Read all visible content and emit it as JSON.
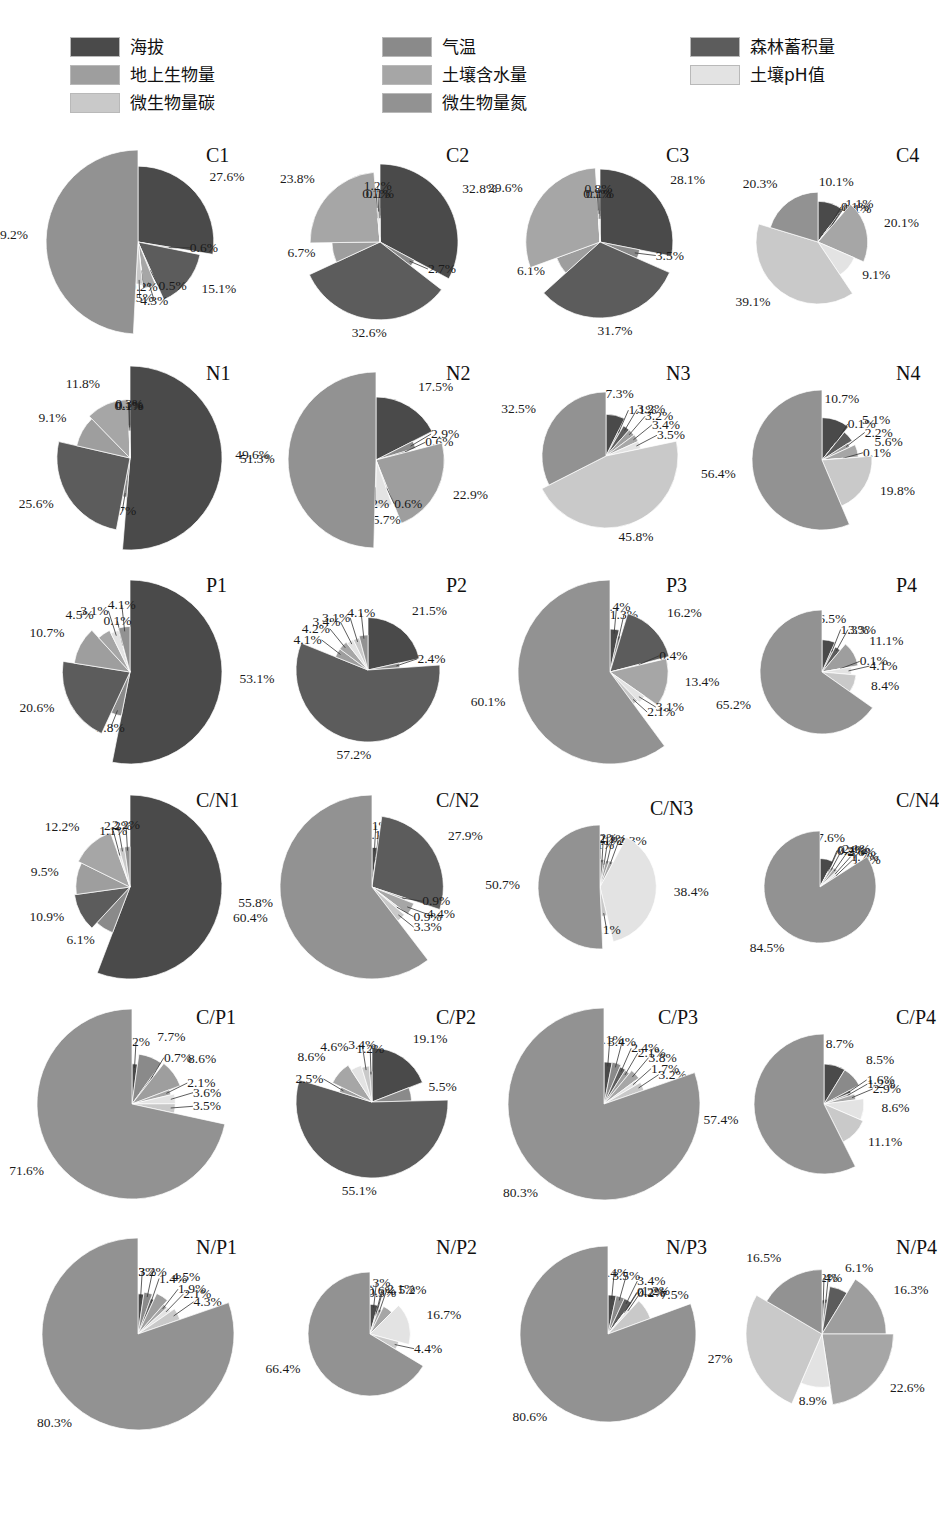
{
  "legend": {
    "columns": [
      {
        "items": [
          {
            "label": "海拔",
            "color": "#4a4a4a",
            "key": "altitude"
          },
          {
            "label": "地上生物量",
            "color": "#9e9e9e",
            "key": "aboveground-biomass"
          },
          {
            "label": "微生物量碳",
            "color": "#c9c9c9",
            "key": "microbial-biomass-carbon"
          }
        ]
      },
      {
        "items": [
          {
            "label": "气温",
            "color": "#8a8a8a",
            "key": "air-temperature"
          },
          {
            "label": "土壤含水量",
            "color": "#a6a6a6",
            "key": "soil-water-content"
          },
          {
            "label": "微生物量氮",
            "color": "#929292",
            "key": "microbial-biomass-nitrogen"
          }
        ]
      },
      {
        "items": [
          {
            "label": "森林蓄积量",
            "color": "#5c5c5c",
            "key": "forest-stock-volume"
          },
          {
            "label": "土壤pH值",
            "color": "#e3e3e3",
            "key": "soil-ph"
          }
        ]
      }
    ]
  },
  "series_order": [
    "altitude",
    "air-temperature",
    "forest-stock-volume",
    "aboveground-biomass",
    "soil-water-content",
    "soil-ph",
    "microbial-biomass-carbon",
    "microbial-biomass-nitrogen"
  ],
  "series_colors": [
    "#4a4a4a",
    "#8a8a8a",
    "#5c5c5c",
    "#9e9e9e",
    "#a6a6a6",
    "#e3e3e3",
    "#c9c9c9",
    "#929292"
  ],
  "chart_data": [
    {
      "type": "pie",
      "title": "C1",
      "labels": [
        "27.6%",
        "0.6%",
        "15.1%",
        "0.5%",
        "4.3%",
        "0.2%",
        "2.5%",
        "49.2%"
      ],
      "values": [
        27.6,
        0.6,
        15.1,
        0.5,
        4.3,
        0.2,
        2.5,
        49.2
      ]
    },
    {
      "type": "pie",
      "title": "C2",
      "labels": [
        "32.8%",
        "2.7%",
        "32.6%",
        "6.7%",
        "23.8%",
        "0.1%",
        "1.2%",
        "0.1%"
      ],
      "values": [
        32.8,
        2.7,
        32.6,
        6.7,
        23.8,
        0.1,
        1.2,
        0.1
      ]
    },
    {
      "type": "pie",
      "title": "C3",
      "labels": [
        "28.1%",
        "3.5%",
        "31.7%",
        "6.1%",
        "29.6%",
        "0.1%",
        "0.8%",
        "0.1%"
      ],
      "values": [
        28.1,
        3.5,
        31.7,
        6.1,
        29.6,
        0.1,
        0.8,
        0.1
      ]
    },
    {
      "type": "pie",
      "title": "C4",
      "labels": [
        "10.1%",
        "0.1%",
        "1.1%",
        "0.1%",
        "20.1%",
        "9.1%",
        "39.1%",
        "20.3%"
      ],
      "values": [
        10.1,
        0.1,
        1.1,
        0.1,
        20.1,
        9.1,
        39.1,
        20.3
      ]
    },
    {
      "type": "pie",
      "title": "N1",
      "labels": [
        "51.3%",
        "1.7%",
        "25.6%",
        "9.1%",
        "11.8%",
        "0.1%",
        "0.3%",
        "0.1%"
      ],
      "values": [
        51.3,
        1.7,
        25.6,
        9.1,
        11.8,
        0.1,
        0.3,
        0.1
      ]
    },
    {
      "type": "pie",
      "title": "N2",
      "labels": [
        "17.5%",
        "2.9%",
        "0.6%",
        "22.9%",
        "0.6%",
        "5.7%",
        "0.2%",
        "49.6%"
      ],
      "values": [
        17.5,
        2.9,
        0.6,
        22.9,
        0.6,
        5.7,
        0.2,
        49.6
      ]
    },
    {
      "type": "pie",
      "title": "N3",
      "labels": [
        "7.3%",
        "1.1%",
        "3.2%",
        "3.2%",
        "3.4%",
        "3.5%",
        "45.8%",
        "32.5%"
      ],
      "values": [
        7.3,
        1.1,
        3.2,
        3.2,
        3.4,
        3.5,
        45.8,
        32.5
      ]
    },
    {
      "type": "pie",
      "title": "N4",
      "labels": [
        "10.7%",
        "0.1%",
        "5.1%",
        "2.2%",
        "5.6%",
        "0.1%",
        "19.8%",
        "56.4%"
      ],
      "values": [
        10.7,
        0.1,
        5.1,
        2.2,
        5.6,
        0.1,
        19.8,
        56.4
      ]
    },
    {
      "type": "pie",
      "title": "P1",
      "labels": [
        "53.1%",
        "3.8%",
        "20.6%",
        "10.7%",
        "4.5%",
        "3.1%",
        "0.1%",
        "4.1%"
      ],
      "values": [
        53.1,
        3.8,
        20.6,
        10.7,
        4.5,
        3.1,
        0.1,
        4.1
      ]
    },
    {
      "type": "pie",
      "title": "P2",
      "labels": [
        "21.5%",
        "2.4%",
        "57.2%",
        "4.1%",
        "4.2%",
        "3.4%",
        "3.1%",
        "4.1%"
      ],
      "values": [
        21.5,
        2.4,
        57.2,
        4.1,
        4.2,
        3.4,
        3.1,
        4.1
      ]
    },
    {
      "type": "pie",
      "title": "P3",
      "labels": [
        "3.4%",
        "1.3%",
        "16.2%",
        "0.4%",
        "13.4%",
        "3.1%",
        "2.1%",
        "60.1%"
      ],
      "values": [
        3.4,
        1.3,
        16.2,
        0.4,
        13.4,
        3.1,
        2.1,
        60.1
      ]
    },
    {
      "type": "pie",
      "title": "P4",
      "labels": [
        "6.5%",
        "1.3%",
        "3.3%",
        "11.1%",
        "0.1%",
        "4.1%",
        "8.4%",
        "65.2%"
      ],
      "values": [
        6.5,
        1.3,
        3.3,
        11.1,
        0.1,
        4.1,
        8.4,
        65.2
      ]
    },
    {
      "type": "pie",
      "title": "C/N1",
      "labels": [
        "55.8%",
        "6.1%",
        "10.9%",
        "9.5%",
        "12.2%",
        "1.1%",
        "2.2%",
        "2.2%"
      ],
      "values": [
        55.8,
        6.1,
        10.9,
        9.5,
        12.2,
        1.1,
        2.2,
        2.2
      ]
    },
    {
      "type": "pie",
      "title": "C/N2",
      "labels": [
        "2.1%",
        "0.1%",
        "27.9%",
        "0.9%",
        "4.4%",
        "0.9%",
        "3.3%",
        "60.4%"
      ],
      "values": [
        2.1,
        0.1,
        27.9,
        0.9,
        4.4,
        0.9,
        3.3,
        60.4
      ]
    },
    {
      "type": "pie",
      "title": "C/N3",
      "labels": [
        "0.1%",
        "2.2%",
        "1.1%",
        "2.1%",
        "2.3%",
        "38.4%",
        "3.1%",
        "50.7%"
      ],
      "values": [
        0.1,
        2.2,
        1.1,
        2.1,
        2.3,
        38.4,
        3.1,
        50.7
      ]
    },
    {
      "type": "pie",
      "title": "C/N4",
      "labels": [
        "7.6%",
        "0.2%",
        "0.4%",
        "2.1%",
        "2.6%",
        "1.7%",
        "1.4%",
        "84.5%"
      ],
      "values": [
        7.6,
        0.2,
        0.4,
        2.1,
        2.6,
        1.7,
        1.4,
        84.5
      ]
    },
    {
      "type": "pie",
      "title": "C/P1",
      "labels": [
        "2.2%",
        "7.7%",
        "0.7%",
        "8.6%",
        "2.1%",
        "3.6%",
        "3.5%",
        "71.6%"
      ],
      "values": [
        2.2,
        7.7,
        0.7,
        8.6,
        2.1,
        3.6,
        3.5,
        71.6
      ]
    },
    {
      "type": "pie",
      "title": "C/P2",
      "labels": [
        "19.1%",
        "5.5%",
        "55.1%",
        "2.5%",
        "8.6%",
        "4.6%",
        "3.4%",
        "1.2%"
      ],
      "values": [
        19.1,
        5.5,
        55.1,
        2.5,
        8.6,
        4.6,
        3.4,
        1.2
      ]
    },
    {
      "type": "pie",
      "title": "C/P3",
      "labels": [
        "3.1%",
        "3.4%",
        "2.4%",
        "2.1%",
        "3.8%",
        "1.7%",
        "3.2%",
        "80.3%"
      ],
      "values": [
        3.1,
        3.4,
        2.4,
        2.1,
        3.8,
        1.7,
        3.2,
        80.3
      ]
    },
    {
      "type": "pie",
      "title": "C/P4",
      "labels": [
        "8.7%",
        "8.5%",
        "1.6%",
        "1.2%",
        "2.9%",
        "8.6%",
        "11.1%",
        "57.4%"
      ],
      "values": [
        8.7,
        8.5,
        1.6,
        1.2,
        2.9,
        8.6,
        11.1,
        57.4
      ]
    },
    {
      "type": "pie",
      "title": "N/P1",
      "labels": [
        "2.3%",
        "3.2%",
        "1.4%",
        "4.5%",
        "1.9%",
        "2.1%",
        "4.3%",
        "80.3%"
      ],
      "values": [
        2.3,
        3.2,
        1.4,
        4.5,
        1.9,
        2.1,
        4.3,
        80.3
      ]
    },
    {
      "type": "pie",
      "title": "N/P2",
      "labels": [
        "4.3%",
        "0.6%",
        "0.3%",
        "2.1%",
        "5.2%",
        "16.7%",
        "4.4%",
        "66.4%"
      ],
      "values": [
        4.3,
        0.6,
        0.3,
        2.1,
        5.2,
        16.7,
        4.4,
        66.4
      ]
    },
    {
      "type": "pie",
      "title": "N/P3",
      "labels": [
        "3.4%",
        "3.5%",
        "3.4%",
        "0.2%",
        "0.2%",
        "1.2%",
        "7.5%",
        "80.6%"
      ],
      "values": [
        3.4,
        3.5,
        3.4,
        0.2,
        0.2,
        1.2,
        7.5,
        80.6
      ]
    },
    {
      "type": "pie",
      "title": "N/P4",
      "labels": [
        "1.2%",
        "1.4%",
        "6.1%",
        "16.3%",
        "22.6%",
        "8.9%",
        "27%",
        "16.5%"
      ],
      "values": [
        1.2,
        1.4,
        6.1,
        16.3,
        22.6,
        8.9,
        27.0,
        16.5
      ]
    }
  ]
}
